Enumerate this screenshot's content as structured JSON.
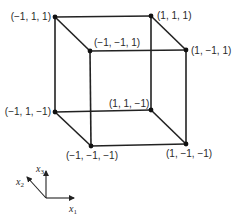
{
  "diagram": {
    "vertices": [
      {
        "id": "v_m1_1_1",
        "label": "(−1, 1, 1)",
        "x": 55,
        "y": 17
      },
      {
        "id": "v_1_1_1",
        "label": "(1, 1, 1)",
        "x": 151,
        "y": 16
      },
      {
        "id": "v_m1_m1_1",
        "label": "(−1, −1, 1)",
        "x": 90,
        "y": 51
      },
      {
        "id": "v_1_m1_1",
        "label": "(1, −1, 1)",
        "x": 186,
        "y": 50
      },
      {
        "id": "v_m1_1_m1",
        "label": "(−1, 1, −1)",
        "x": 55,
        "y": 112
      },
      {
        "id": "v_1_1_m1",
        "label": "(1, 1, −1)",
        "x": 151,
        "y": 110
      },
      {
        "id": "v_m1_m1_m1",
        "label": "(−1, −1, −1)",
        "x": 91,
        "y": 146
      },
      {
        "id": "v_1_m1_m1",
        "label": "(1, −1, −1)",
        "x": 186,
        "y": 144
      }
    ],
    "axes": {
      "x1": {
        "label": "x",
        "sub": "1"
      },
      "x2": {
        "label": "x",
        "sub": "2"
      },
      "x3": {
        "label": "x",
        "sub": "3"
      }
    }
  }
}
